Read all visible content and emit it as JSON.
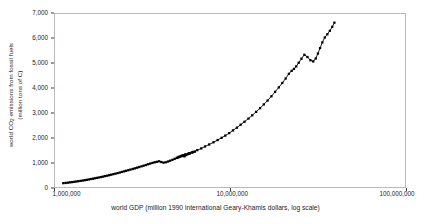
{
  "chart_data": {
    "type": "scatter",
    "title": "",
    "xlabel": "world GDP (million 1990 international Geary-Khamis dollars, log scale)",
    "ylabel_line1": "world CO",
    "ylabel_sub": "2",
    "ylabel_line1b": " emissions from fossil fuels",
    "ylabel_line2": "(million tons of C)",
    "ylabel_full": "world CO2 emissions from fossil fuels (million tons of C)",
    "xscale": "log",
    "yscale": "linear",
    "xlim": [
      1000000,
      100000000
    ],
    "ylim": [
      0,
      7000
    ],
    "grid": false,
    "legend": false,
    "marker": "filled-square",
    "marker_color": "#000000",
    "line_color": "#000000",
    "xticks": [
      1000000,
      10000000,
      100000000
    ],
    "xticklabels": [
      "1,000,000",
      "10,000,000",
      "100,000,000"
    ],
    "yticks": [
      0,
      1000,
      2000,
      3000,
      4000,
      5000,
      6000,
      7000
    ],
    "yticklabels": [
      "0",
      "1,000",
      "2,000",
      "3,000",
      "4,000",
      "5,000",
      "6,000",
      "7,000"
    ],
    "series": [
      {
        "name": "world CO2 vs GDP trajectory",
        "x": [
          1115000,
          1150000,
          1185000,
          1220000,
          1255000,
          1290000,
          1325000,
          1360000,
          1400000,
          1440000,
          1480000,
          1520000,
          1560000,
          1600000,
          1645000,
          1690000,
          1735000,
          1780000,
          1830000,
          1880000,
          1930000,
          1985000,
          2040000,
          2095000,
          2155000,
          2215000,
          2280000,
          2345000,
          2410000,
          2480000,
          2550000,
          2625000,
          2700000,
          2780000,
          2860000,
          2945000,
          3030000,
          3120000,
          3210000,
          3305000,
          3400000,
          3500000,
          3605000,
          3710000,
          3820000,
          3935000,
          4050000,
          4170000,
          4290000,
          4420000,
          4550000,
          4690000,
          4830000,
          4975000,
          5120000,
          5275000,
          5430000,
          5360000,
          5200000,
          5050000,
          4980000,
          5100000,
          5300000,
          5550000,
          5800000,
          6050000,
          6300000,
          6100000,
          5900000,
          5750000,
          5600000,
          5500000,
          5480000,
          5620000,
          5850000,
          6150000,
          6500000,
          6850000,
          7200000,
          7600000,
          8050000,
          8500000,
          8950000,
          9400000,
          9900000,
          10400000,
          10950000,
          11500000,
          12100000,
          12750000,
          13400000,
          14100000,
          14850000,
          15600000,
          16400000,
          17250000,
          18100000,
          19000000,
          19900000,
          20800000,
          21700000,
          22500000,
          23200000,
          23900000,
          24700000,
          25600000,
          26600000,
          27700000,
          28800000,
          29900000,
          30900000,
          31800000,
          32700000,
          33700000,
          34800000,
          36000000,
          37200000,
          38400000,
          39500000
        ],
        "y": [
          155,
          165,
          175,
          188,
          198,
          210,
          222,
          235,
          248,
          262,
          275,
          290,
          305,
          320,
          335,
          352,
          368,
          385,
          402,
          420,
          440,
          458,
          478,
          498,
          520,
          540,
          562,
          585,
          608,
          632,
          656,
          680,
          705,
          730,
          755,
          782,
          808,
          835,
          862,
          890,
          920,
          948,
          975,
          1000,
          1020,
          1040,
          1010,
          985,
          1000,
          1030,
          1065,
          1100,
          1140,
          1180,
          1215,
          1250,
          1290,
          1260,
          1230,
          1195,
          1175,
          1220,
          1270,
          1320,
          1360,
          1400,
          1430,
          1395,
          1360,
          1330,
          1300,
          1265,
          1240,
          1290,
          1355,
          1420,
          1490,
          1560,
          1640,
          1720,
          1810,
          1900,
          1990,
          2080,
          2180,
          2290,
          2400,
          2520,
          2640,
          2770,
          2900,
          3040,
          3190,
          3340,
          3500,
          3670,
          3850,
          4030,
          4210,
          4390,
          4580,
          4700,
          4780,
          4880,
          5030,
          5190,
          5350,
          5260,
          5130,
          5080,
          5200,
          5400,
          5620,
          5850,
          6050,
          6180,
          6320,
          6480,
          6650
        ]
      }
    ],
    "annotations": [
      "Curve shows a loop/backtrack near 1,000-1,400 million tons of C (war-era GDP contraction).",
      "A dip near 5,100-5,350 million tons of C appears at the upper right (early-1980s oil shock)."
    ]
  }
}
